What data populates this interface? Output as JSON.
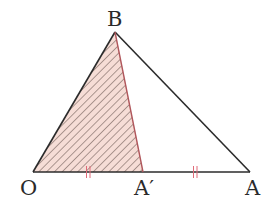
{
  "diagram": {
    "type": "geometry-triangle",
    "colors": {
      "stroke": "#2b2b2b",
      "fill": "#f6ddd6",
      "hatch": "#6e5a55",
      "tick": "#e06a78",
      "edge_BA_prime": "#b0575c"
    },
    "points": {
      "B": {
        "label": "B",
        "x": 115,
        "y": 32
      },
      "O": {
        "label": "O",
        "x": 33,
        "y": 172
      },
      "A_prime": {
        "label": "A′",
        "x": 143,
        "y": 172
      },
      "A": {
        "label": "A",
        "x": 250,
        "y": 172
      }
    },
    "segments": [
      {
        "from": "O",
        "to": "B"
      },
      {
        "from": "B",
        "to": "A"
      },
      {
        "from": "O",
        "to": "A"
      },
      {
        "from": "B",
        "to": "A_prime"
      }
    ],
    "shaded_region": {
      "vertices": [
        "O",
        "B",
        "A_prime"
      ],
      "pattern": "diagonal-hatch"
    },
    "equal_marks": [
      {
        "segment": "O-A′",
        "marks": 2
      },
      {
        "segment": "A′-A",
        "marks": 2
      }
    ]
  }
}
